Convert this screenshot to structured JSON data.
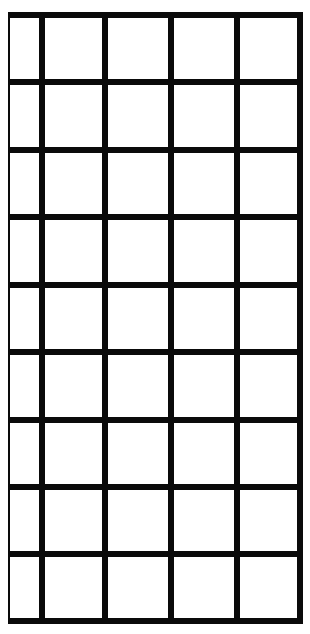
{
  "grid": {
    "columns": 5,
    "rows": 9,
    "line_color": "#0a0a0a",
    "background_color": "#ffffff",
    "bounds": {
      "left": 8,
      "top": 14,
      "right": 302,
      "bottom": 624
    },
    "vertical_lines": [
      {
        "x": 8,
        "width": 2
      },
      {
        "x": 39,
        "width": 6
      },
      {
        "x": 102,
        "width": 6
      },
      {
        "x": 168,
        "width": 6
      },
      {
        "x": 234,
        "width": 6
      },
      {
        "x": 297,
        "width": 6
      }
    ],
    "horizontal_lines": [
      {
        "y": 12,
        "height": 6
      },
      {
        "y": 79,
        "height": 6
      },
      {
        "y": 147,
        "height": 6
      },
      {
        "y": 214,
        "height": 6
      },
      {
        "y": 282,
        "height": 6
      },
      {
        "y": 349,
        "height": 6
      },
      {
        "y": 417,
        "height": 6
      },
      {
        "y": 484,
        "height": 6
      },
      {
        "y": 551,
        "height": 6
      },
      {
        "y": 618,
        "height": 6
      }
    ]
  }
}
